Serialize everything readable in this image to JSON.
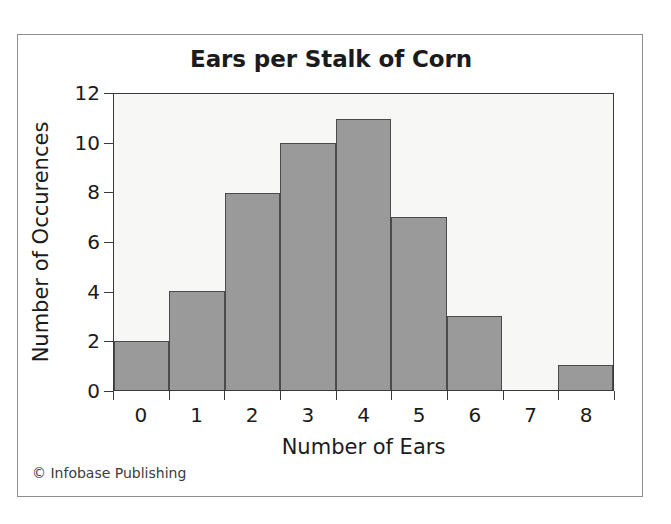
{
  "figure": {
    "title": "Ears per Stalk of Corn",
    "copyright": "© Infobase Publishing"
  },
  "chart_data": {
    "type": "bar",
    "title": "Ears per Stalk of Corn",
    "subtitle": "",
    "xlabel": "Number of Ears",
    "ylabel": "Number of Occurences",
    "categories": [
      "0",
      "1",
      "2",
      "3",
      "4",
      "5",
      "6",
      "7",
      "8"
    ],
    "values": [
      2,
      4,
      8,
      10,
      11,
      7,
      3,
      0,
      1
    ],
    "ylim": [
      0,
      12
    ],
    "y_ticks": [
      0,
      2,
      4,
      6,
      8,
      10,
      12
    ],
    "y_tick_labels": [
      "0",
      "2",
      "4",
      "6",
      "8",
      "10",
      "12"
    ],
    "x_tick_labels": [
      "0",
      "1",
      "2",
      "3",
      "4",
      "5",
      "6",
      "7",
      "8"
    ],
    "grid": false,
    "legend": "none",
    "bar_color": "#9a9a9a",
    "bar_edge_color": "#4b4b4b",
    "plot_background": "#f7f7f5",
    "axis_color": "#3a3a3a",
    "text_color": "#1b1b1b",
    "histogram_style": "adjacent bins, ticks at bin boundaries, labels centered on bins"
  }
}
